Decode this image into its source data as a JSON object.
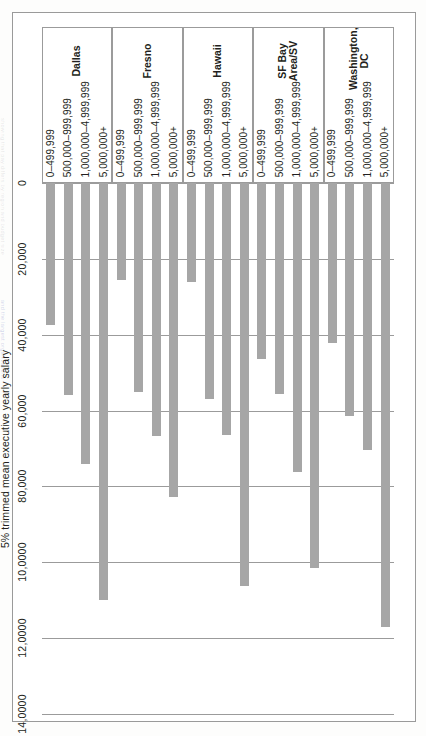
{
  "figure": {
    "axis_title": "5% trimmed mean executive yearly salary",
    "bar_color": "#a6a6a6",
    "grid_color": "#9b9b9b",
    "frame_color": "#9a9a9a"
  },
  "chart_data": {
    "type": "bar",
    "orientation": "horizontal",
    "title": "",
    "subtitle": "",
    "xlabel": "5% trimmed mean executive yearly salary",
    "ylabel": "",
    "xlim": [
      0,
      140000
    ],
    "grid": true,
    "legend": "none",
    "tick_labels": [
      "0",
      "20,000",
      "40,000",
      "60,000",
      "80,000",
      "10,0000",
      "12,0000",
      "14,0000"
    ],
    "tick_values": [
      0,
      20000,
      40000,
      60000,
      80000,
      100000,
      120000,
      140000
    ],
    "group_label_key": "Metro area",
    "category_label_key": "Organization budget (USD)",
    "categories": [
      "5,000,000+",
      "1,000,000–4,999,999",
      "500,000–999,999",
      "0–499,999"
    ],
    "groups": [
      {
        "name": "Washington, DC",
        "name_lines": [
          "Washington,",
          "DC"
        ],
        "bars": [
          {
            "label": "5,000,000+",
            "value": 117000
          },
          {
            "label": "1,000,000–4,999,999",
            "value": 70500
          },
          {
            "label": "500,000–999,999",
            "value": 61500
          },
          {
            "label": "0–499,999",
            "value": 42200
          }
        ]
      },
      {
        "name": "SF Bay Area/SV",
        "name_lines": [
          "SF Bay",
          "Area/SV"
        ],
        "bars": [
          {
            "label": "5,000,000+",
            "value": 101500
          },
          {
            "label": "1,000,000–4,999,999",
            "value": 76300
          },
          {
            "label": "500,000–999,999",
            "value": 55500
          },
          {
            "label": "0–499,999",
            "value": 46500
          }
        ]
      },
      {
        "name": "Hawaii",
        "name_lines": [
          "Hawaii"
        ],
        "bars": [
          {
            "label": "5,000,000+",
            "value": 106200
          },
          {
            "label": "1,000,000–4,999,999",
            "value": 66500
          },
          {
            "label": "500,000–999,999",
            "value": 57000
          },
          {
            "label": "0–499,999",
            "value": 26200
          }
        ]
      },
      {
        "name": "Fresno",
        "name_lines": [
          "Fresno"
        ],
        "bars": [
          {
            "label": "5,000,000+",
            "value": 82900
          },
          {
            "label": "1,000,000–4,999,999",
            "value": 66700
          },
          {
            "label": "500,000–999,999",
            "value": 55200
          },
          {
            "label": "0–499,999",
            "value": 25700
          }
        ]
      },
      {
        "name": "Dallas",
        "name_lines": [
          "Dallas"
        ],
        "bars": [
          {
            "label": "5,000,000+",
            "value": 110000
          },
          {
            "label": "1,000,000–4,999,999",
            "value": 74200
          },
          {
            "label": "500,000–999,999",
            "value": 56000
          },
          {
            "label": "0–499,999",
            "value": 37500
          }
        ]
      }
    ]
  }
}
